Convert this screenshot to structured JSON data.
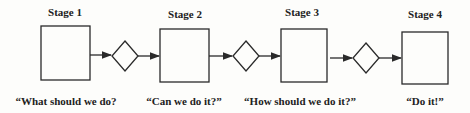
{
  "diagram": {
    "stages": [
      {
        "title": "Stage 1",
        "question": "“What should we do?"
      },
      {
        "title": "Stage 2",
        "question": "“Can we do it?”"
      },
      {
        "title": "Stage 3",
        "question": "“How should we do it?”"
      },
      {
        "title": "Stage 4",
        "question": "“Do it!”"
      }
    ],
    "connectors": [
      "arrow",
      "decision-diamond",
      "arrow"
    ],
    "colors": {
      "stroke": "#2a2a2a",
      "background": "#fdfdfb"
    }
  }
}
